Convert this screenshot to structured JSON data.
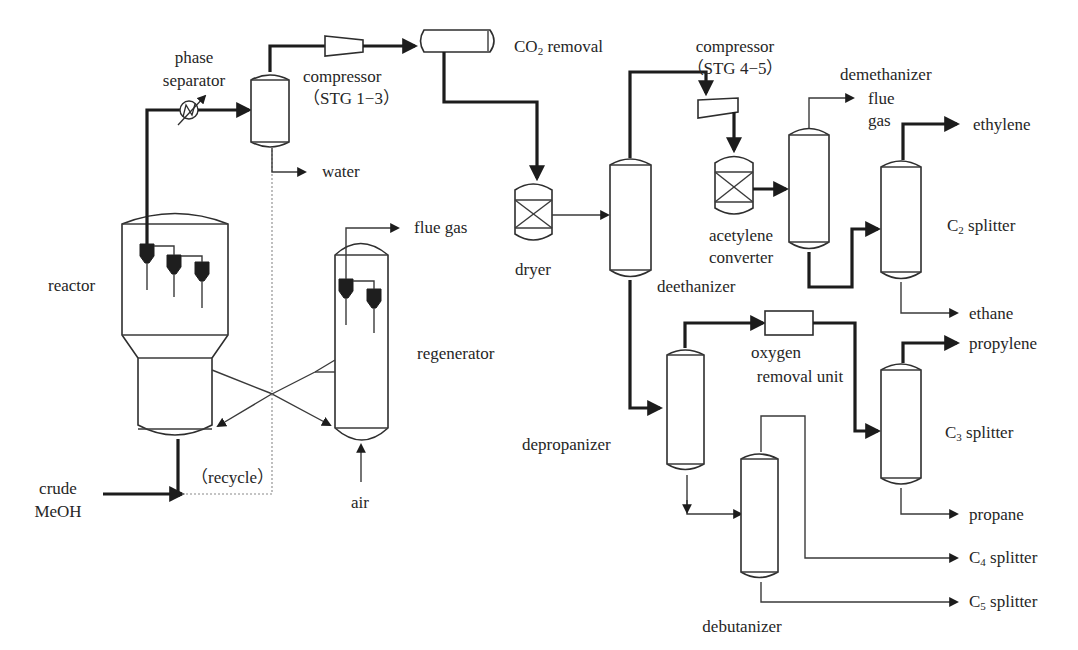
{
  "diagram": {
    "units": {
      "phase_separator": "phase\nseparator",
      "phase_separator_line1": "phase",
      "phase_separator_line2": "separator",
      "compressor_1_line1": "compressor",
      "compressor_1_line2": "（STG 1−3）",
      "co2_removal_prefix": "CO",
      "co2_removal_sub": "2",
      "co2_removal_suffix": " removal",
      "compressor_2_line1": "compressor",
      "compressor_2_line2": "（STG 4−5）",
      "demethanizer": "demethanizer",
      "reactor": "reactor",
      "regenerator": "regenerator",
      "dryer": "dryer",
      "deethanizer": "deethanizer",
      "acetylene_converter_line1": "acetylene",
      "acetylene_converter_line2": "converter",
      "c2_splitter_prefix": "C",
      "c2_splitter_sub": "2",
      "c2_splitter_suffix": " splitter",
      "depropanizer": "depropanizer",
      "oxygen_removal_line1": "oxygen",
      "oxygen_removal_line2": "removal unit",
      "c3_splitter_prefix": "C",
      "c3_splitter_sub": "3",
      "c3_splitter_suffix": " splitter",
      "debutanizer": "debutanizer"
    },
    "streams": {
      "water": "water",
      "flue_gas": "flue gas",
      "demethanizer_flue_line1": "flue",
      "demethanizer_flue_line2": "gas",
      "ethylene": "ethylene",
      "ethane": "ethane",
      "propylene": "propylene",
      "propane": "propane",
      "c4_prefix": "C",
      "c4_sub": "4",
      "c4_suffix": " splitter",
      "c5_prefix": "C",
      "c5_sub": "5",
      "c5_suffix": " splitter",
      "air": "air",
      "recycle": "（recycle）",
      "crude_meoh_line1": "crude",
      "crude_meoh_line2": "MeOH"
    },
    "colors": {
      "line": "#1c1c1c",
      "background": "#ffffff",
      "recycle_line": "#8a8a8a"
    }
  }
}
